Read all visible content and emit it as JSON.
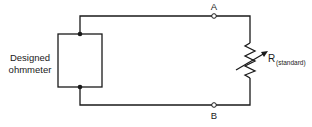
{
  "diagram": {
    "ohmmeter_label_line1": "Designed",
    "ohmmeter_label_line2": "ohmmeter",
    "terminal_a_label": "A",
    "terminal_b_label": "B",
    "resistor_label_main": "R",
    "resistor_label_sub": "(standard)",
    "line_color": "#1a1a1a"
  }
}
